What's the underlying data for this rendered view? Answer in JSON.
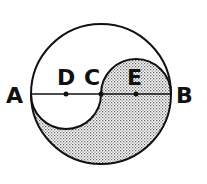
{
  "diagram": {
    "type": "geometry",
    "colors": {
      "stroke": "#111111",
      "fill_pattern": "#555555",
      "background": "#ffffff"
    },
    "labels": {
      "A": "A",
      "B": "B",
      "C": "C",
      "D": "D",
      "E": "E"
    },
    "points": {
      "A": [
        31,
        94
      ],
      "B": [
        171,
        94
      ],
      "C": [
        101,
        94
      ],
      "D": [
        66,
        94
      ],
      "E": [
        136,
        94
      ]
    },
    "big_circle": {
      "cx": 101,
      "cy": 94,
      "r": 70
    },
    "small_semicircles": [
      {
        "center": "D",
        "r": 35,
        "side": "below"
      },
      {
        "center": "E",
        "r": 35,
        "side": "above"
      }
    ]
  }
}
